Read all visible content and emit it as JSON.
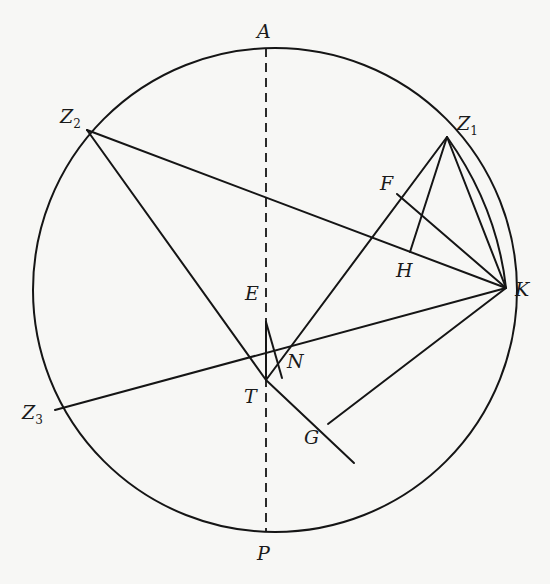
{
  "diagram": {
    "type": "geometric-construction",
    "circle": {
      "cx": 275,
      "cy": 290,
      "r": 242
    },
    "points": {
      "A": {
        "label": "A",
        "sub": "",
        "x": 266,
        "y": 48,
        "lx": 257,
        "ly": 38
      },
      "P": {
        "label": "P",
        "sub": "",
        "x": 266,
        "y": 532,
        "lx": 257,
        "ly": 560
      },
      "T": {
        "label": "T",
        "sub": "",
        "x": 266,
        "y": 380,
        "lx": 244,
        "ly": 403
      },
      "E": {
        "label": "E",
        "sub": "",
        "x": 266,
        "y": 322,
        "lx": 245,
        "ly": 300
      },
      "N": {
        "label": "N",
        "sub": "",
        "x": 282,
        "y": 378,
        "lx": 287,
        "ly": 368
      },
      "Z1": {
        "label": "Z",
        "sub": "1",
        "x": 447,
        "y": 137,
        "lx": 457,
        "ly": 130
      },
      "Z2": {
        "label": "Z",
        "sub": "2",
        "x": 87,
        "y": 130,
        "lx": 60,
        "ly": 123
      },
      "Z3": {
        "label": "Z",
        "sub": "3",
        "x": 55,
        "y": 410,
        "lx": 22,
        "ly": 419
      },
      "K": {
        "label": "K",
        "sub": "",
        "x": 506,
        "y": 288,
        "lx": 515,
        "ly": 296
      },
      "F": {
        "label": "F",
        "sub": "",
        "x": 397,
        "y": 194,
        "lx": 380,
        "ly": 190
      },
      "H": {
        "label": "H",
        "sub": "",
        "x": 410,
        "y": 252,
        "lx": 396,
        "ly": 277
      },
      "G": {
        "label": "G",
        "sub": "",
        "x": 328,
        "y": 424,
        "lx": 304,
        "ly": 444
      }
    },
    "segments": [
      {
        "from": "Z2",
        "to": "K"
      },
      {
        "from": "Z2",
        "to": "T"
      },
      {
        "from": "Z3",
        "to": "K"
      },
      {
        "from": "T",
        "to": "Z1"
      },
      {
        "from": "Z1",
        "to": "K"
      },
      {
        "from": "Z1",
        "to": "H"
      },
      {
        "from": "F",
        "to": "K"
      },
      {
        "from": "G",
        "to": "K"
      },
      {
        "from": "T",
        "to": "E"
      },
      {
        "from": "E",
        "to": "N"
      }
    ],
    "extension": {
      "from": "T",
      "to_x": 354,
      "to_y": 463,
      "note": "line Z2-T extended past G"
    },
    "dashed_axis": {
      "from": "A",
      "to": "P"
    },
    "arc": {
      "from": "Z1",
      "to": "K",
      "note": "inner arc Z1 to K"
    }
  }
}
